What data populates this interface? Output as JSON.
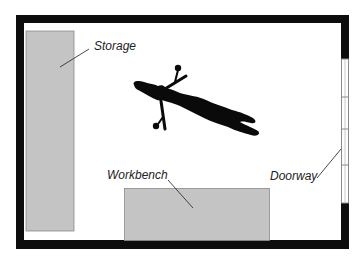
{
  "diagram": {
    "type": "floor-plan",
    "labels": {
      "storage": "Storage",
      "workbench": "Workbench",
      "doorway": "Doorway"
    },
    "colors": {
      "wall": "#0d0d0d",
      "furniture_fill": "#c4c4c4",
      "furniture_stroke": "#8a8a8a",
      "door_stroke": "#8a8a8a",
      "figure": "#0a0a0a",
      "leader": "#333333"
    },
    "elements": [
      {
        "id": "storage",
        "label": "Storage",
        "kind": "furniture"
      },
      {
        "id": "workbench",
        "label": "Workbench",
        "kind": "furniture"
      },
      {
        "id": "doorway",
        "label": "Doorway",
        "kind": "opening"
      },
      {
        "id": "figure",
        "label": "",
        "kind": "person-silhouette-lying"
      }
    ]
  }
}
